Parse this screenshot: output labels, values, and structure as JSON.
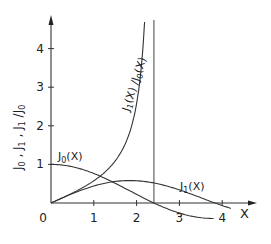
{
  "chart_data": {
    "type": "line",
    "title": "",
    "xlabel": "X",
    "ylabel": "J0 , J1 , J1/J0",
    "xlim": [
      0,
      4.8
    ],
    "ylim": [
      0,
      4.9
    ],
    "x_ticks": [
      "0",
      "1",
      "2",
      "3",
      "4"
    ],
    "y_ticks": [
      "1",
      "2",
      "3",
      "4"
    ],
    "grid": false,
    "legend": "inline labels",
    "annotations": [
      {
        "text": "vertical line at first zero of J0",
        "x": 2.405
      }
    ],
    "series": [
      {
        "name": "J0(X)",
        "label": "J0(X)",
        "x": [
          0,
          0.5,
          1.0,
          1.5,
          2.0,
          2.405,
          3.0,
          3.5,
          3.8
        ],
        "values": [
          1.0,
          0.938,
          0.765,
          0.512,
          0.224,
          0.0,
          -0.26,
          -0.38,
          -0.403
        ]
      },
      {
        "name": "J1(X)",
        "label": "J1(X)",
        "x": [
          0,
          0.5,
          1.0,
          1.5,
          1.84,
          2.0,
          2.5,
          3.0,
          3.5,
          3.83,
          4.2
        ],
        "values": [
          0.0,
          0.242,
          0.44,
          0.558,
          0.582,
          0.577,
          0.497,
          0.339,
          0.137,
          0.0,
          -0.138
        ]
      },
      {
        "name": "J1(X)/J0(X)",
        "label": "J1(X)/J0(X)",
        "x": [
          0,
          0.5,
          1.0,
          1.5,
          1.8,
          2.0,
          2.2,
          2.3,
          2.35,
          2.38
        ],
        "values": [
          0.0,
          0.258,
          0.575,
          1.09,
          1.71,
          2.58,
          4.08,
          6.0,
          8.5,
          12.0
        ]
      }
    ]
  },
  "labels": {
    "x_axis": "X",
    "y_axis_parts": [
      "J",
      "0",
      " , J",
      "1",
      " , J",
      "1",
      " /J",
      "0"
    ],
    "j0": "J0(X)",
    "j1": "J1(X)",
    "ratio": "J1(X)/J0(X)"
  }
}
